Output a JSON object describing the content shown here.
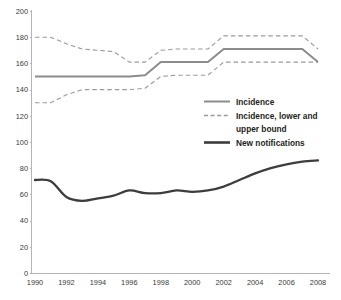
{
  "chart_data": {
    "type": "line",
    "title": "",
    "subtitle": "",
    "xlabel": "",
    "ylabel": "",
    "xlim": [
      1990,
      2008
    ],
    "ylim": [
      0,
      200
    ],
    "grid": false,
    "legend_position": "center-right",
    "x": [
      1990,
      1991,
      1992,
      1993,
      1994,
      1995,
      1996,
      1997,
      1998,
      1999,
      2000,
      2001,
      2002,
      2003,
      2004,
      2005,
      2006,
      2007,
      2008
    ],
    "xticks": [
      1990,
      1992,
      1994,
      1996,
      1998,
      2000,
      2002,
      2004,
      2006,
      2008
    ],
    "xtick_labels": [
      "1990",
      "1992",
      "1994",
      "1996",
      "1998",
      "2000",
      "2002",
      "2004",
      "2006",
      "2008"
    ],
    "yticks": [
      0,
      20,
      40,
      60,
      80,
      100,
      120,
      140,
      160,
      180,
      200
    ],
    "ytick_labels": [
      "0",
      "20",
      "40",
      "60",
      "80",
      "100",
      "120",
      "140",
      "160",
      "180",
      "200"
    ],
    "series": [
      {
        "name": "Incidence",
        "style": "solid",
        "color": "#8c8c8c",
        "values": [
          150,
          150,
          150,
          150,
          150,
          150,
          150,
          151,
          161,
          161,
          161,
          161,
          171,
          171,
          171,
          171,
          171,
          171,
          161
        ]
      },
      {
        "name": "Incidence, upper bound",
        "style": "dashed",
        "color": "#9a9a9a",
        "values": [
          180,
          180,
          175,
          171,
          170,
          169,
          161,
          161,
          170,
          171,
          171,
          171,
          181,
          181,
          181,
          181,
          181,
          181,
          171
        ]
      },
      {
        "name": "Incidence, lower bound",
        "style": "dashed",
        "color": "#9a9a9a",
        "values": [
          130,
          130,
          136,
          140,
          140,
          140,
          140,
          141,
          150,
          151,
          151,
          151,
          161,
          161,
          161,
          161,
          161,
          161,
          161
        ]
      },
      {
        "name": "New notifications",
        "style": "solid",
        "color": "#3d3d3d",
        "values": [
          71,
          70,
          58,
          55,
          57,
          59,
          63,
          61,
          61,
          63,
          62,
          63,
          66,
          71,
          76,
          80,
          83,
          85,
          86
        ]
      }
    ],
    "legend_entries": [
      {
        "label": "Incidence",
        "style": "solid",
        "color": "#8c8c8c"
      },
      {
        "label": "Incidence, lower and",
        "label2": "upper bound",
        "style": "dashed",
        "color": "#9a9a9a"
      },
      {
        "label": "New notifications",
        "style": "solid",
        "color": "#3d3d3d"
      }
    ]
  },
  "legend": {
    "entry1": "Incidence",
    "entry2_line1": "Incidence, lower and",
    "entry2_line2": "upper bound",
    "entry3": "New notifications"
  },
  "axes": {
    "y_ticks": [
      "200",
      "180",
      "160",
      "140",
      "120",
      "100",
      "80",
      "60",
      "40",
      "20",
      "0"
    ],
    "x_ticks": [
      "1990",
      "1992",
      "1994",
      "1996",
      "1998",
      "2000",
      "2002",
      "2004",
      "2006",
      "2008"
    ]
  },
  "colors": {
    "incidence": "#8c8c8c",
    "bounds": "#9a9a9a",
    "notifications": "#3d3d3d",
    "axis": "#b5b5b5",
    "text": "#231f20"
  }
}
